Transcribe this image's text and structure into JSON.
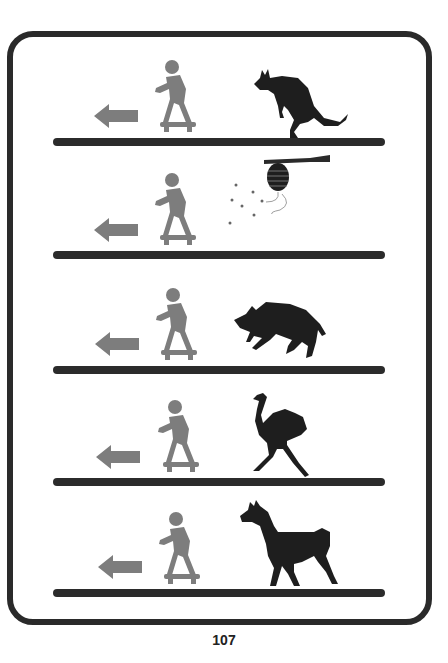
{
  "page": {
    "number": "107"
  },
  "colors": {
    "frame": "#2a2a2a",
    "ground": "#2b2b2b",
    "figure": "#7d7d7d",
    "animal": "#1e1e1e"
  },
  "rows": [
    {
      "figure": "skateboarder",
      "direction": "left-arrow",
      "animal": "kangaroo"
    },
    {
      "figure": "skateboarder",
      "direction": "left-arrow",
      "animal": "beehive-with-bees"
    },
    {
      "figure": "skateboarder",
      "direction": "left-arrow",
      "animal": "wild-boar"
    },
    {
      "figure": "skateboarder",
      "direction": "left-arrow",
      "animal": "ostrich"
    },
    {
      "figure": "skateboarder",
      "direction": "left-arrow",
      "animal": "llama"
    }
  ]
}
